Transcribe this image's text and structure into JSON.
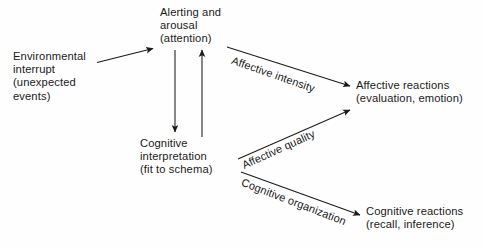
{
  "diagram": {
    "background_color": "#fefefe",
    "stroke_color": "#1a1a1a",
    "nodes": [
      {
        "id": "environmental-interrupt",
        "text": "Environmental\ninterrupt\n(unexpected\nevents)"
      },
      {
        "id": "alerting-arousal",
        "text": "Alerting and\narousal\n(attention)"
      },
      {
        "id": "cognitive-interpretation",
        "text": "Cognitive\ninterpretation\n(fit to schema)"
      },
      {
        "id": "affective-reactions",
        "text": "Affective reactions\n(evaluation, emotion)"
      },
      {
        "id": "cognitive-reactions",
        "text": "Cognitive reactions\n(recall, inference)"
      }
    ],
    "edges": [
      {
        "id": "interrupt-to-alerting",
        "label": "",
        "from": "environmental-interrupt",
        "to": "alerting-arousal"
      },
      {
        "id": "alerting-to-cognitive",
        "label": "",
        "from": "alerting-arousal",
        "to": "cognitive-interpretation"
      },
      {
        "id": "cognitive-to-alerting",
        "label": "",
        "from": "cognitive-interpretation",
        "to": "alerting-arousal"
      },
      {
        "id": "affective-intensity",
        "label": "Affective intensity",
        "from": "alerting-arousal",
        "to": "affective-reactions"
      },
      {
        "id": "affective-quality",
        "label": "Affective quality",
        "from": "cognitive-interpretation",
        "to": "affective-reactions"
      },
      {
        "id": "cognitive-organization",
        "label": "Cognitive organization",
        "from": "cognitive-interpretation",
        "to": "cognitive-reactions"
      }
    ]
  }
}
